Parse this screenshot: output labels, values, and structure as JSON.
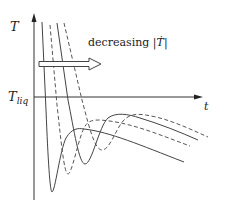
{
  "figure": {
    "y_axis_label": "T",
    "x_axis_label": "t",
    "reference_line_label": "T",
    "reference_line_subscript": "liq",
    "annotation_text": "decreasing |",
    "annotation_symbol": "Ṫ",
    "annotation_close": "|",
    "arrow_direction": "right",
    "colors": {
      "line": "#444444",
      "axis": "#333333",
      "background": "#ffffff"
    },
    "curves": [
      {
        "style": "solid",
        "order": 1
      },
      {
        "style": "dashed",
        "order": 2
      },
      {
        "style": "solid",
        "order": 3
      },
      {
        "style": "dashed",
        "order": 4
      }
    ]
  }
}
